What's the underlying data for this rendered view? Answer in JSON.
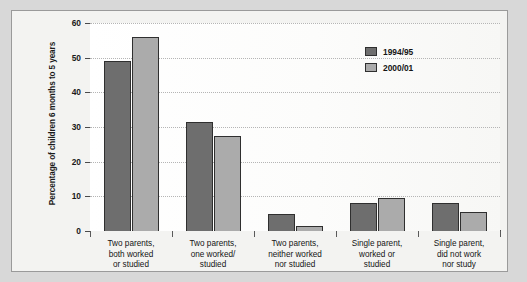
{
  "chart_data": {
    "type": "bar",
    "title": "",
    "xlabel": "",
    "ylabel": "Percentage of children 6 months to 5 years",
    "ylim": [
      0,
      60
    ],
    "yticks": [
      0,
      10,
      20,
      30,
      40,
      50,
      60
    ],
    "ytick_labels": [
      "0",
      "10",
      "20",
      "30",
      "40",
      "50",
      "60"
    ],
    "grid": true,
    "legend_position": "top-right",
    "categories": [
      "Two parents,\nboth worked\nor studied",
      "Two parents,\none worked/\nstudied",
      "Two parents,\nneither worked\nnor studied",
      "Single parent,\nworked or\nstudied",
      "Single parent,\ndid not work\nnor study"
    ],
    "category_lines": [
      [
        "Two parents,",
        "both worked",
        "or studied"
      ],
      [
        "Two parents,",
        "one worked/",
        "studied"
      ],
      [
        "Two parents,",
        "neither worked",
        "nor studied"
      ],
      [
        "Single parent,",
        "worked or",
        "studied"
      ],
      [
        "Single parent,",
        "did not work",
        "nor study"
      ]
    ],
    "series": [
      {
        "name": "1994/95",
        "color": "#6e6e6e",
        "values": [
          49,
          31.5,
          5,
          8,
          8
        ]
      },
      {
        "name": "2000/01",
        "color": "#ababab",
        "values": [
          56,
          27.5,
          1.5,
          9.5,
          5.5
        ]
      }
    ]
  },
  "legend": {
    "items": [
      {
        "label": "1994/95",
        "color": "#6e6e6e"
      },
      {
        "label": "2000/01",
        "color": "#ababab"
      }
    ]
  },
  "colors": {
    "series_1994": "#6e6e6e",
    "series_2000": "#ababab",
    "page_background": "#d8d8d8",
    "panel_background": "#f3f3f1",
    "plot_background": "#fbfbfa",
    "axis": "#4a4a4a",
    "gridline": "#b5b5b5"
  }
}
